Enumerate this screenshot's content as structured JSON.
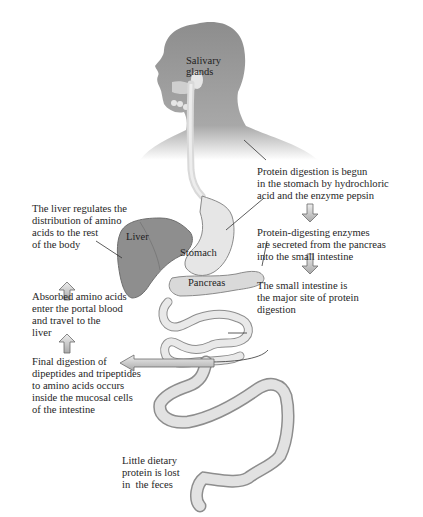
{
  "figure": {
    "organs": {
      "salivary": "Salivary\nglands",
      "liver": "Liver",
      "stomach": "Stomach",
      "pancreas": "Pancreas"
    },
    "steps_right": [
      {
        "text": "Protein digestion is begun\nin the stomach by hydrochloric\nacid and the enzyme pepsin"
      },
      {
        "text": "Protein-digesting enzymes\nare secreted from the pancreas\ninto the small intestine"
      },
      {
        "text": "The small intestine is\nthe major site of protein\ndigestion"
      }
    ],
    "steps_left": [
      {
        "text": "Final digestion of\ndipeptides and tripeptides\nto amino acids occurs\ninside the mucosal cells\nof the intestine"
      },
      {
        "text": "Absorbed amino acids\nenter the portal blood\nand travel to the\nliver"
      },
      {
        "text": "The liver regulates the\ndistribution of amino\nacids to the rest\nof the body"
      }
    ],
    "feces_note": "Little dietary\nprotein is lost\nin  the feces",
    "colors": {
      "body": "#9a9a9a",
      "liver": "#8a8a8a",
      "organ": "#e4e4e4",
      "arrow": "#c8c8c8"
    }
  }
}
